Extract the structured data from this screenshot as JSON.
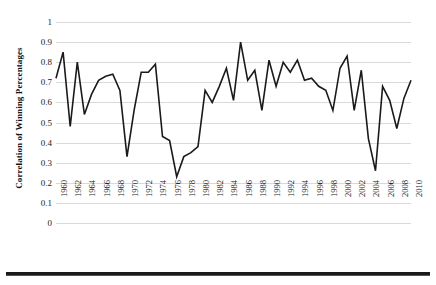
{
  "chart_data": {
    "type": "line",
    "title": "",
    "xlabel": "",
    "ylabel": "Correlation of Winning Percentages",
    "ylim": [
      0,
      1
    ],
    "ytick_values": [
      0,
      0.1,
      0.2,
      0.3,
      0.4,
      0.5,
      0.6,
      0.7,
      0.8,
      0.9,
      1
    ],
    "ytick_labels": [
      "0",
      "0.1",
      "0.2",
      "0.3",
      "0.4",
      "0.5",
      "0.6",
      "0.7",
      "0.8",
      "0.9",
      "1"
    ],
    "xlim": [
      1960,
      2010
    ],
    "xtick_labels": [
      "1960",
      "1962",
      "1964",
      "1966",
      "1968",
      "1970",
      "1972",
      "1974",
      "1976",
      "1978",
      "1980",
      "1982",
      "1984",
      "1986",
      "1988",
      "1990",
      "1992",
      "1994",
      "1996",
      "1998",
      "2000",
      "2002",
      "2004",
      "2006",
      "2008",
      "2010"
    ],
    "grid": "horizontal",
    "legend": "none",
    "line_color": "#1a1a1a",
    "gridline_color": "#d9d9d9",
    "x": [
      1960,
      1961,
      1962,
      1963,
      1964,
      1965,
      1966,
      1967,
      1968,
      1969,
      1970,
      1971,
      1972,
      1973,
      1974,
      1975,
      1976,
      1977,
      1978,
      1979,
      1980,
      1981,
      1982,
      1983,
      1984,
      1985,
      1986,
      1987,
      1988,
      1989,
      1990,
      1991,
      1992,
      1993,
      1994,
      1995,
      1996,
      1997,
      1998,
      1999,
      2000,
      2001,
      2002,
      2003,
      2004,
      2005,
      2006,
      2007,
      2008,
      2009,
      2010
    ],
    "values": [
      0.72,
      0.85,
      0.48,
      0.8,
      0.54,
      0.64,
      0.71,
      0.73,
      0.74,
      0.66,
      0.33,
      0.56,
      0.75,
      0.75,
      0.79,
      0.43,
      0.41,
      0.23,
      0.33,
      0.35,
      0.38,
      0.66,
      0.6,
      0.68,
      0.77,
      0.61,
      0.9,
      0.71,
      0.76,
      0.56,
      0.81,
      0.68,
      0.8,
      0.75,
      0.81,
      0.71,
      0.72,
      0.68,
      0.66,
      0.56,
      0.77,
      0.83,
      0.56,
      0.76,
      0.42,
      0.26,
      0.68,
      0.61,
      0.47,
      0.62,
      0.71
    ]
  },
  "figure": {
    "bottom_rule": ""
  }
}
